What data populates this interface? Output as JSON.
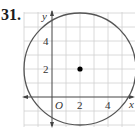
{
  "problem": {
    "number": "31."
  },
  "axes": {
    "x_label": "x",
    "y_label": "y",
    "origin_label": "O",
    "x_ticks": [
      {
        "value": 2,
        "label": "2"
      },
      {
        "value": 4,
        "label": "4"
      }
    ],
    "y_ticks": [
      {
        "value": 2,
        "label": "2"
      },
      {
        "value": 4,
        "label": "4"
      }
    ]
  },
  "grid": {
    "unit": 1,
    "x_range": [
      -2,
      6
    ],
    "y_range": [
      -2,
      6
    ]
  },
  "circle": {
    "center": [
      2,
      2
    ],
    "radius": 4,
    "color": "#555555"
  },
  "center_point": {
    "x": 2,
    "y": 2,
    "color": "#000000"
  },
  "colors": {
    "grid": "#d0d0d0",
    "axis": "#444444"
  }
}
